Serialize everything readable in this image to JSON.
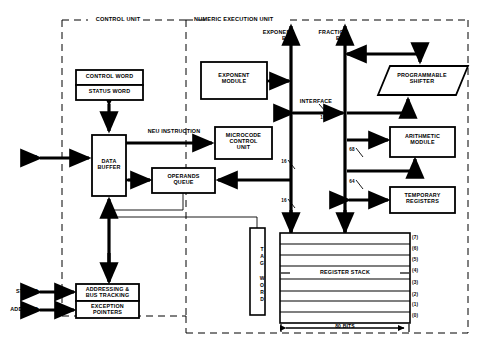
{
  "diagram": {
    "zones": [
      {
        "id": "control-unit",
        "label": "CONTROL UNIT",
        "x": 62,
        "y": 20,
        "w": 124,
        "h": 296
      },
      {
        "id": "numeric-execution-unit",
        "label": "NUMERIC EXECUTION UNIT",
        "x": 186,
        "y": 20,
        "w": 282,
        "h": 313
      }
    ],
    "blocks": [
      {
        "id": "control-word",
        "label": "CONTROL WORD",
        "x": 76,
        "y": 70,
        "w": 67,
        "h": 15
      },
      {
        "id": "status-word",
        "label": "STATUS WORD",
        "x": 76,
        "y": 85,
        "w": 67,
        "h": 15
      },
      {
        "id": "data-buffer",
        "label": "DATA\nBUFFER",
        "x": 92,
        "y": 135,
        "w": 34,
        "h": 61
      },
      {
        "id": "addressing-bus-tracking",
        "label": "ADDRESSING &\nBUS TRACKING",
        "x": 76,
        "y": 284,
        "w": 63,
        "h": 17
      },
      {
        "id": "exception-pointers",
        "label": "EXCEPTION\nPOINTERS",
        "x": 76,
        "y": 301,
        "w": 63,
        "h": 17
      },
      {
        "id": "exponent-module",
        "label": "EXPONENT\nMODULE",
        "x": 201,
        "y": 62,
        "w": 66,
        "h": 37
      },
      {
        "id": "microcode-control-unit",
        "label": "MICROCODE\nCONTROL\nUNIT",
        "x": 215,
        "y": 127,
        "w": 57,
        "h": 32
      },
      {
        "id": "operands-queue",
        "label": "OPERANDS\nQUEUE",
        "x": 152,
        "y": 168,
        "w": 63,
        "h": 25
      },
      {
        "id": "arithmetic-module",
        "label": "ARITHMETIC\nMODULE",
        "x": 390,
        "y": 127,
        "w": 65,
        "h": 30
      },
      {
        "id": "temporary-registers",
        "label": "TEMPORARY\nREGISTERS",
        "x": 390,
        "y": 187,
        "w": 65,
        "h": 26
      },
      {
        "id": "register-stack",
        "label": "REGISTER STACK",
        "x": 280,
        "y": 233,
        "w": 130,
        "h": 90
      },
      {
        "id": "tag-word",
        "label": "TAG WORD",
        "x": 250,
        "y": 228,
        "w": 15,
        "h": 87
      }
    ],
    "shifter": {
      "id": "programmable-shifter",
      "label": "PROGRAMMABLE\nSHIFTER",
      "x": 378,
      "y": 66,
      "w": 90,
      "h": 29,
      "skew": 12
    },
    "bus_labels": [
      {
        "id": "exponent-bus",
        "label": "EXPONENT\nBUS",
        "x": 248,
        "y": 30
      },
      {
        "id": "fraction-bus",
        "label": "FRACTION\nBUS",
        "x": 318,
        "y": 30
      },
      {
        "id": "interface",
        "label": "INTERFACE",
        "x": 302,
        "y": 99
      },
      {
        "id": "neu-instruction",
        "label": "NEU INSTRUCTION",
        "x": 131,
        "y": 129
      }
    ],
    "io_labels": [
      {
        "id": "data",
        "label": "DATA",
        "x": 22,
        "y": 158
      },
      {
        "id": "status",
        "label": "STATUS",
        "x": 16,
        "y": 287
      },
      {
        "id": "address",
        "label": "ADDRESS",
        "x": 10,
        "y": 308
      }
    ],
    "bus_widths": [
      {
        "id": "width-interface-16",
        "label": "16",
        "x": 322,
        "y": 116
      },
      {
        "id": "width-exponent-16",
        "label": "16",
        "x": 283,
        "y": 166
      },
      {
        "id": "width-fraction-68",
        "label": "68",
        "x": 352,
        "y": 153
      },
      {
        "id": "width-fraction-64",
        "label": "64",
        "x": 352,
        "y": 185
      },
      {
        "id": "width-exponent-lower-16",
        "label": "16",
        "x": 283,
        "y": 205
      }
    ],
    "register_indices": [
      "(7)",
      "(6)",
      "(5)",
      "(4)",
      "(3)",
      "(2)",
      "(1)",
      "(0)"
    ],
    "register_index_x": 414,
    "stack_width_label": "80 BITS",
    "colors": {
      "line": "#000000",
      "background": "#ffffff",
      "dash": "#000000"
    }
  }
}
